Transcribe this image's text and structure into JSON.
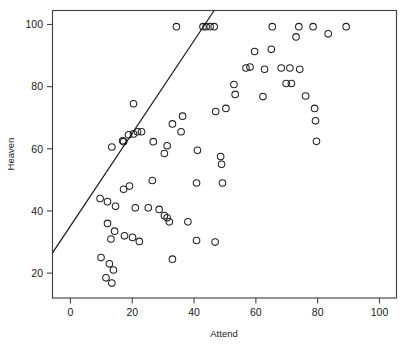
{
  "chart_data": {
    "type": "scatter",
    "title": "",
    "subtitle": "",
    "xlabel": "Attend",
    "ylabel": "Heaven",
    "xlim": [
      -5.8,
      105.5
    ],
    "ylim": [
      12.0,
      104.5
    ],
    "xticks": [
      0,
      20,
      40,
      60,
      80,
      100
    ],
    "yticks": [
      20,
      40,
      60,
      80,
      100
    ],
    "xticklabels": [
      "0",
      "20",
      "40",
      "60",
      "80",
      "100"
    ],
    "yticklabels": [
      "20",
      "40",
      "60",
      "80",
      "100"
    ],
    "grid": false,
    "legend": null,
    "marker": "open-circle",
    "marker_size": 3.3,
    "annotations": [],
    "series": [
      {
        "name": "observations",
        "marker": "open-circle",
        "color": "#222222",
        "points": [
          [
            34.3,
            99.3
          ],
          [
            42.9,
            99.3
          ],
          [
            43.9,
            99.3
          ],
          [
            45.2,
            99.3
          ],
          [
            46.5,
            99.3
          ],
          [
            65.3,
            99.3
          ],
          [
            73.9,
            99.3
          ],
          [
            78.5,
            99.3
          ],
          [
            89.2,
            99.3
          ],
          [
            83.4,
            97.0
          ],
          [
            73.0,
            96.0
          ],
          [
            65.0,
            92.0
          ],
          [
            59.6,
            91.3
          ],
          [
            56.8,
            86.0
          ],
          [
            58.1,
            86.3
          ],
          [
            68.2,
            86.0
          ],
          [
            71.0,
            86.0
          ],
          [
            74.2,
            85.6
          ],
          [
            62.8,
            85.6
          ],
          [
            52.9,
            80.7
          ],
          [
            69.8,
            81.0
          ],
          [
            71.5,
            81.0
          ],
          [
            53.3,
            77.5
          ],
          [
            62.3,
            76.8
          ],
          [
            76.1,
            77.0
          ],
          [
            79.0,
            73.0
          ],
          [
            79.3,
            69.0
          ],
          [
            79.6,
            62.4
          ],
          [
            50.3,
            73.0
          ],
          [
            47.0,
            72.0
          ],
          [
            20.4,
            74.5
          ],
          [
            36.3,
            70.5
          ],
          [
            33.0,
            68.0
          ],
          [
            35.8,
            65.5
          ],
          [
            18.8,
            64.5
          ],
          [
            20.4,
            64.8
          ],
          [
            21.7,
            65.5
          ],
          [
            23.0,
            65.5
          ],
          [
            13.4,
            60.6
          ],
          [
            17.2,
            62.3
          ],
          [
            16.9,
            62.6
          ],
          [
            26.8,
            62.3
          ],
          [
            31.3,
            61.0
          ],
          [
            30.4,
            58.5
          ],
          [
            41.1,
            59.5
          ],
          [
            48.6,
            57.5
          ],
          [
            48.9,
            55.0
          ],
          [
            49.2,
            49.0
          ],
          [
            40.8,
            49.0
          ],
          [
            26.5,
            49.8
          ],
          [
            19.1,
            48.0
          ],
          [
            17.2,
            47.0
          ],
          [
            9.6,
            44.0
          ],
          [
            12.0,
            43.0
          ],
          [
            14.6,
            41.5
          ],
          [
            21.0,
            41.0
          ],
          [
            25.2,
            41.0
          ],
          [
            28.7,
            40.5
          ],
          [
            30.4,
            38.5
          ],
          [
            31.3,
            37.8
          ],
          [
            32.0,
            36.5
          ],
          [
            38.0,
            36.5
          ],
          [
            40.8,
            30.5
          ],
          [
            12.0,
            36.0
          ],
          [
            14.3,
            33.5
          ],
          [
            13.1,
            31.0
          ],
          [
            17.5,
            32.0
          ],
          [
            20.1,
            31.5
          ],
          [
            22.3,
            30.2
          ],
          [
            9.9,
            25.0
          ],
          [
            12.6,
            23.0
          ],
          [
            13.9,
            21.0
          ],
          [
            11.5,
            18.5
          ],
          [
            13.4,
            16.8
          ],
          [
            46.8,
            30.0
          ],
          [
            33.0,
            24.5
          ]
        ]
      }
    ],
    "fit_line": {
      "name": "least-squares fit",
      "x_start": -5.8,
      "y_start": 26.5,
      "x_end": 46.5,
      "y_end": 104.5
    }
  }
}
